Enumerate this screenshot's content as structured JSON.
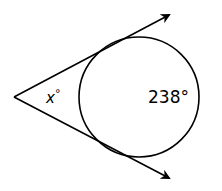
{
  "diagram": {
    "type": "tangent-tangent angle",
    "vertex_angle_label": "x°",
    "vertex_angle_var": "x",
    "arc_label": "238°",
    "arc_measure": 238,
    "stroke_color": "#000000",
    "background": "#ffffff"
  }
}
